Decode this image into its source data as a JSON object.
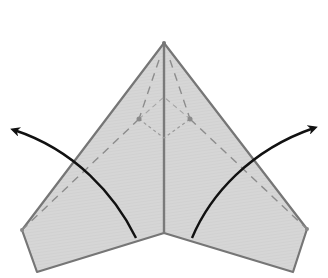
{
  "diagram": {
    "title": "",
    "colors": {
      "paper_fill": "#d9d9d9",
      "paper_edge": "#7a7a7a",
      "crease_dashed": "#8c8c8c",
      "arrow": "#111111",
      "background": "#ffffff"
    },
    "elements": {
      "paper": "paper-shape",
      "center_crease": "center-crease",
      "fold_lines": [
        "left-outer-dashed-fold",
        "right-outer-dashed-fold",
        "left-inner-dashed-fold",
        "right-inner-dashed-fold",
        "inner-diamond-fold"
      ],
      "arrows": [
        {
          "name": "left-fold-arrow",
          "direction": "up-left"
        },
        {
          "name": "right-fold-arrow",
          "direction": "up-right"
        }
      ]
    }
  }
}
